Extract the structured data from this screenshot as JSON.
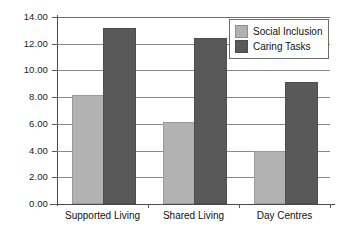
{
  "chart_data": {
    "type": "bar",
    "title": "",
    "xlabel": "",
    "ylabel": "",
    "categories": [
      "Supported Living",
      "Shared Living",
      "Day Centres"
    ],
    "series": [
      {
        "name": "Social Inclusion",
        "values": [
          8.0,
          6.0,
          3.8
        ],
        "color": "#b2b2b2"
      },
      {
        "name": "Caring Tasks",
        "values": [
          13.0,
          12.3,
          9.0
        ],
        "color": "#595959"
      }
    ],
    "ylim": [
      0,
      14
    ],
    "ytick_step": 2,
    "ytick_labels": [
      "0.00",
      "2.00",
      "4.00",
      "6.00",
      "8.00",
      "10.00",
      "12.00",
      "14.00"
    ],
    "grid": true,
    "legend_position": "upper-right",
    "background_color": "#ffffff",
    "axis_color": "#4a4a4a",
    "grid_color": "#8a8a8a"
  },
  "legend": {
    "items": [
      {
        "label": "Social Inclusion"
      },
      {
        "label": "Caring Tasks"
      }
    ]
  }
}
